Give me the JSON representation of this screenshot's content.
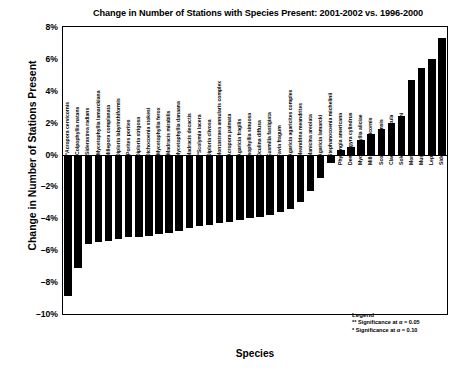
{
  "chart_data": {
    "type": "bar",
    "title": "Change in Number of Stations with Species Present: 2001-2002 vs. 1996-2000",
    "xlabel": "Species",
    "ylabel": "Change in Number of Stations Present",
    "ylim": [
      -10,
      8
    ],
    "ytick_labels": [
      "8%",
      "6%",
      "4%",
      "2%",
      "0%",
      "–2%",
      "–4%",
      "–6%",
      "–8%",
      "–10%"
    ],
    "ytick_values": [
      8,
      6,
      4,
      2,
      0,
      -2,
      -4,
      -6,
      -8,
      -10
    ],
    "grid": false,
    "legend_position": "bottom-right",
    "bar_color": "#000000",
    "categories": [
      "**Acropora cervicornis",
      "*Colpophyllia natans",
      "*Siderastrea radians",
      "*Mycetophyllia lamarckiana",
      "Millepora complanata",
      "Diploria labyrinthiformis",
      "*Porites porites",
      "Diploria strigosa",
      "Dichocoenia stokesi",
      "*Mycetophyllia ferox",
      "*Madracis mirabilis",
      "Mycetophyllia danaana",
      "Madracis decactis",
      "**Scolymia lacera",
      "Diploria clivosa",
      "Montastraea annularis complex",
      "Acropora palmata",
      "Agaricia fragilis",
      "Isophyllia sinuosa",
      "Oculina diffusa",
      "Eusmilia fastigiata",
      "Favia fragum",
      "Agaricia agaricites complex",
      "Meandrina meandrites",
      "Manicina areolata",
      "Agaricia lamarcki",
      "Stephanocoenia michelinii",
      "Phyllangia americana",
      "Dendrogyra cylindrus",
      "Mycetophyllia aliciae",
      "Millepora alcicornis",
      "Scolymia cubensis",
      "Cladocora arbuscula",
      "Solenastrea bournoni",
      "Montastraea cavernosa",
      "Mussa angulosa",
      "Leptoseris cucullata",
      "Siderastrea siderea"
    ],
    "values": [
      -8.9,
      -7.1,
      -5.6,
      -5.5,
      -5.4,
      -5.3,
      -5.2,
      -5.2,
      -5.1,
      -5.0,
      -4.9,
      -4.8,
      -4.6,
      -4.5,
      -4.4,
      -4.3,
      -4.2,
      -4.1,
      -4.0,
      -3.9,
      -3.8,
      -3.6,
      -3.4,
      -3.0,
      -2.3,
      -1.5,
      -0.5,
      0.3,
      0.5,
      0.9,
      1.3,
      1.6,
      2.0,
      2.4,
      4.7,
      5.4,
      6.0,
      7.3
    ]
  },
  "legend": {
    "title": "Legend",
    "entries": [
      "** Significance at α = 0.05",
      "* Significance at α = 0.10"
    ]
  }
}
